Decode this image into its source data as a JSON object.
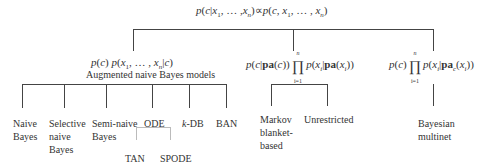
{
  "root": {
    "formula_left": "p(c|x",
    "formula_text": "p(c|x₁, … ,xₙ) ∝ p(c, x₁, … , xₙ)"
  },
  "branches": {
    "anb": {
      "formula": "p(c) p(x₁, … , xₙ|c)",
      "caption": "Augmented naive Bayes models",
      "children": [
        {
          "label": "Naive Bayes"
        },
        {
          "label": "Selective naive Bayes"
        },
        {
          "label": "Semi-naive Bayes"
        },
        {
          "label": "ODE",
          "children": [
            {
              "label": "TAN"
            },
            {
              "label": "SPODE"
            }
          ]
        },
        {
          "label": "k-DB"
        },
        {
          "label": "BAN"
        }
      ]
    },
    "markov": {
      "formula": "p(c|pa(c)) ∏ᵢ₌₁ⁿ p(xᵢ|pa(xᵢ))",
      "children": [
        {
          "label": "Markov blanket-based"
        },
        {
          "label": "Unrestricted"
        }
      ]
    },
    "multinet": {
      "formula": "p(c) ∏ᵢ₌₁ⁿ p(xᵢ|pa_c(xᵢ))",
      "children": [
        {
          "label": "Bayesian multinet"
        }
      ]
    }
  },
  "labels": {
    "naive_bayes_1": "Naive",
    "naive_bayes_2": "Bayes",
    "selective_1": "Selective",
    "selective_2": "naive",
    "selective_3": "Bayes",
    "semi_1": "Semi-naive",
    "semi_2": "Bayes",
    "ode": "ODE",
    "kdb_k": "k",
    "kdb_rest": "-DB",
    "ban": "BAN",
    "tan": "TAN",
    "spode": "SPODE",
    "markov_1": "Markov",
    "markov_2": "blanket-",
    "markov_3": "based",
    "unrestricted": "Unrestricted",
    "multinet_1": "Bayesian",
    "multinet_2": "multinet",
    "anb_caption": "Augmented naive Bayes models"
  },
  "math": {
    "p": "p",
    "c": "c",
    "x": "x",
    "one": "1",
    "n": "n",
    "i": "i",
    "i_eq_1": "i=1",
    "dots": "…",
    "propto": "∝",
    "prod": "∏",
    "pa": "pa",
    "c_sub": "c"
  }
}
